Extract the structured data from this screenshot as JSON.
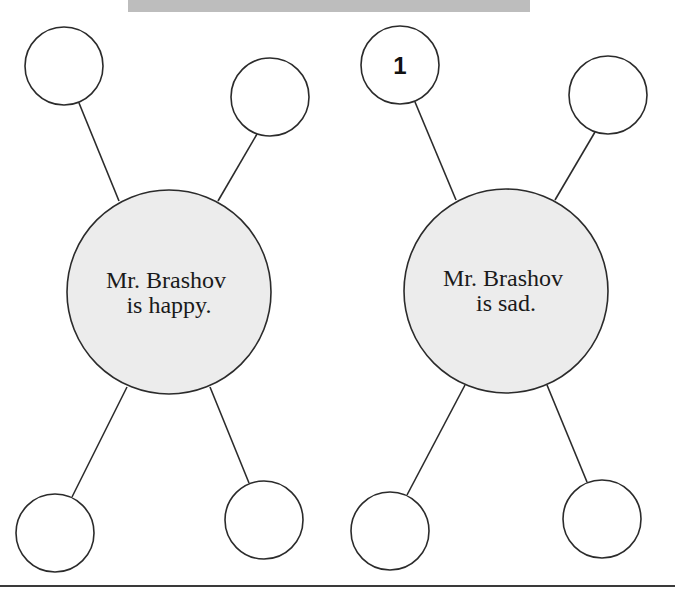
{
  "banner": {
    "color": "#bdbdbd"
  },
  "colors": {
    "stroke": "#2b2b2b",
    "center_fill": "#ececec",
    "leaf_fill": "#ffffff"
  },
  "diagrams": [
    {
      "center": {
        "cx": 169,
        "cy": 292,
        "r": 102,
        "lines": [
          "Mr. Brashov",
          "is happy."
        ]
      },
      "leaves": [
        {
          "cx": 64,
          "cy": 66,
          "r": 39,
          "label": ""
        },
        {
          "cx": 270,
          "cy": 97,
          "r": 39,
          "label": ""
        },
        {
          "cx": 55,
          "cy": 533,
          "r": 39,
          "label": ""
        },
        {
          "cx": 264,
          "cy": 520,
          "r": 39,
          "label": ""
        }
      ]
    },
    {
      "center": {
        "cx": 506,
        "cy": 291,
        "r": 102,
        "lines": [
          "Mr. Brashov",
          "is sad."
        ]
      },
      "leaves": [
        {
          "cx": 400,
          "cy": 65,
          "r": 39,
          "label": "1"
        },
        {
          "cx": 608,
          "cy": 95,
          "r": 39,
          "label": ""
        },
        {
          "cx": 390,
          "cy": 531,
          "r": 39,
          "label": ""
        },
        {
          "cx": 602,
          "cy": 519,
          "r": 39,
          "label": ""
        }
      ]
    }
  ]
}
